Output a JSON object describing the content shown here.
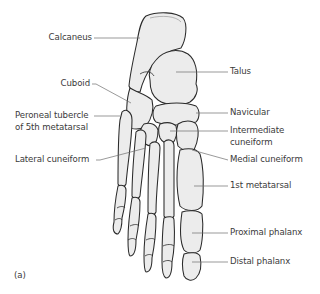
{
  "figure": {
    "panel_label": "(a)",
    "colors": {
      "bone_fill": "#ececec",
      "bone_outline": "#2b2b2b",
      "leader_line": "#6e6e6e",
      "label_text": "#3a3a3a",
      "background": "#ffffff"
    }
  },
  "labels": {
    "left": [
      {
        "text": "Calcaneus"
      },
      {
        "text": "Cuboid"
      },
      {
        "text": "Peroneal tubercle",
        "line2": "of 5th metatarsal"
      },
      {
        "text": "Lateral cuneiform"
      }
    ],
    "right": [
      {
        "text": "Talus"
      },
      {
        "text": "Navicular"
      },
      {
        "text": "Intermediate",
        "line2": "cuneiform"
      },
      {
        "text": "Medial cuneiform"
      },
      {
        "text": "1st metatarsal"
      },
      {
        "text": "Proximal phalanx"
      },
      {
        "text": "Distal phalanx"
      }
    ]
  }
}
